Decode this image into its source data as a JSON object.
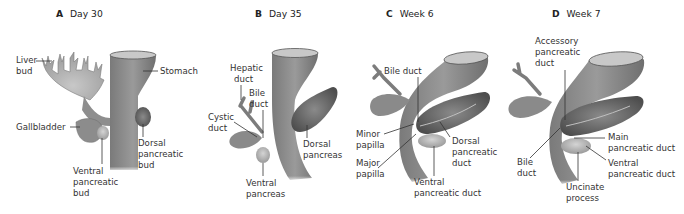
{
  "colors": {
    "tissue": "#8a8a8a",
    "tissue_light": "#b5b5b5",
    "tissue_dark": "#5a5a5a",
    "pancreas": "#6e6e6e",
    "label": "#333333"
  },
  "panels": [
    {
      "letter": "A",
      "title": "Day 30",
      "labels": {
        "liver": [
          "Liver",
          "bud"
        ],
        "stomach": "Stomach",
        "gallbladder": "Gallbladder",
        "dorsal": [
          "Dorsal",
          "pancreatic",
          "bud"
        ],
        "ventral": [
          "Ventral",
          "pancreatic",
          "bud"
        ]
      }
    },
    {
      "letter": "B",
      "title": "Day 35",
      "labels": {
        "hepatic": [
          "Hepatic",
          "duct"
        ],
        "bile": [
          "Bile",
          "duct"
        ],
        "cystic": [
          "Cystic",
          "duct"
        ],
        "dorsal": [
          "Dorsal",
          "pancreas"
        ],
        "ventral": [
          "Ventral",
          "pancreas"
        ]
      }
    },
    {
      "letter": "C",
      "title": "Week 6",
      "labels": {
        "bile": "Bile duct",
        "minor": [
          "Minor",
          "papilla"
        ],
        "major": [
          "Major",
          "papilla"
        ],
        "dorsal": [
          "Dorsal",
          "pancreatic",
          "duct"
        ],
        "ventral": [
          "Ventral",
          "pancreatic duct"
        ]
      }
    },
    {
      "letter": "D",
      "title": "Week 7",
      "labels": {
        "accessory": [
          "Accessory",
          "pancreatic",
          "duct"
        ],
        "main": [
          "Main",
          "pancreatic duct"
        ],
        "ventral": [
          "Ventral",
          "pancreatic duct"
        ],
        "bile": [
          "Bile",
          "duct"
        ],
        "uncinate": [
          "Uncinate",
          "process"
        ]
      }
    }
  ]
}
